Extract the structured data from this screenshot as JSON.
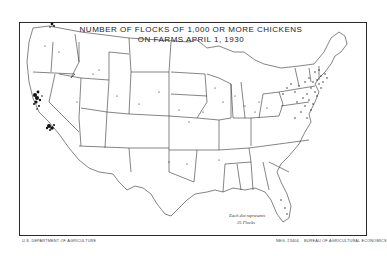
{
  "map": {
    "title_line1": "NUMBER OF FLOCKS OF 1,000 OR MORE CHICKENS",
    "title_line2": "ON FARMS APRIL 1, 1930",
    "region": "United States",
    "legend": {
      "line1": "Each dot represents",
      "line2": "25 Flocks"
    },
    "dot_concentrations": [
      {
        "area": "California - San Francisco Bay / Sonoma area",
        "density": "very high"
      },
      {
        "area": "California - Los Angeles area",
        "density": "very high"
      },
      {
        "area": "Washington - Puget Sound",
        "density": "high"
      },
      {
        "area": "Northeast - New Jersey, Pennsylvania, New York, New England",
        "density": "high"
      },
      {
        "area": "Delmarva / Virginia",
        "density": "medium"
      },
      {
        "area": "Midwest and South",
        "density": "sparse"
      }
    ],
    "colors": {
      "background": "#ffffff",
      "ink": "#1a1a1a",
      "boundary": "#333333"
    }
  },
  "footer": {
    "left": "U.S. DEPARTMENT OF AGRICULTURE",
    "right_neg": "NEG. 23404",
    "right_bureau": "BUREAU OF AGRICULTURAL ECONOMICS"
  }
}
